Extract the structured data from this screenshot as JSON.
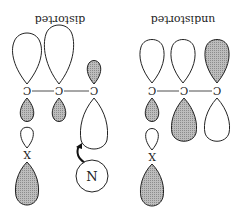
{
  "figure": {
    "orientation": "rotated-180",
    "panels": [
      {
        "id": "distorted",
        "label": "distorted",
        "carbon_label": "C",
        "substituent_label": "X",
        "nucleophile_label": "N"
      },
      {
        "id": "undistorted",
        "label": "undistorted",
        "carbon_label": "C",
        "substituent_label": "X"
      }
    ],
    "colors": {
      "line": "#222222",
      "shaded_lobe": "#b3b3b3",
      "unshaded_lobe": "#ffffff",
      "background": "#ffffff"
    }
  }
}
